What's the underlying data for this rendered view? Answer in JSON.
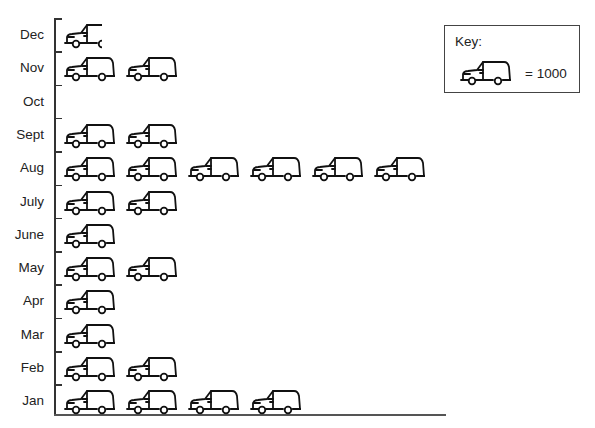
{
  "chart_data": {
    "type": "pictograph",
    "title": "",
    "xlabel": "",
    "ylabel": "",
    "categories": [
      "Dec",
      "Nov",
      "Oct",
      "Sept",
      "Aug",
      "July",
      "June",
      "May",
      "Apr",
      "Mar",
      "Feb",
      "Jan"
    ],
    "symbols": [
      0.5,
      2,
      0,
      2,
      6,
      2,
      1,
      2,
      1,
      1,
      2,
      4
    ],
    "values": [
      500,
      2000,
      0,
      2000,
      6000,
      2000,
      1000,
      2000,
      1000,
      1000,
      2000,
      4000
    ],
    "key": {
      "label": "Key:",
      "symbol": "car-icon",
      "value_text": "= 1000",
      "unit_value": 1000
    },
    "legend_position": "top-right",
    "grid": false
  },
  "rows": [
    {
      "label": "Dec",
      "count": 0.5
    },
    {
      "label": "Nov",
      "count": 2
    },
    {
      "label": "Oct",
      "count": 0
    },
    {
      "label": "Sept",
      "count": 2
    },
    {
      "label": "Aug",
      "count": 6
    },
    {
      "label": "July",
      "count": 2
    },
    {
      "label": "June",
      "count": 1
    },
    {
      "label": "May",
      "count": 2
    },
    {
      "label": "Apr",
      "count": 1
    },
    {
      "label": "Mar",
      "count": 1
    },
    {
      "label": "Feb",
      "count": 2
    },
    {
      "label": "Jan",
      "count": 4
    }
  ],
  "key": {
    "title": "Key:",
    "value": "= 1000"
  }
}
